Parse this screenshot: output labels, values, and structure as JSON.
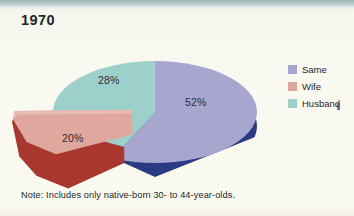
{
  "figure": {
    "title": "1970",
    "note": "Note: Includes only native-born 30- to 44-year-olds.",
    "background_color": "#faf9f2",
    "topbar_color": "#9fb7b8"
  },
  "legend": {
    "position": "right",
    "items": [
      {
        "label": "Same",
        "color": "#a6a6cf",
        "swatch_name": "legend-swatch-same"
      },
      {
        "label": "Wife",
        "color": "#dfa79e",
        "swatch_name": "legend-swatch-wife"
      },
      {
        "label": "Husband",
        "color": "#9ed0cb",
        "swatch_name": "legend-swatch-husband"
      }
    ]
  },
  "labels": {
    "same": "52%",
    "wife": "20%",
    "husband": "28%"
  },
  "chart_data": {
    "type": "pie",
    "title": "1970",
    "xlabel": "",
    "ylabel": "",
    "categories": [
      "Same",
      "Wife",
      "Husband"
    ],
    "values": [
      52,
      20,
      28
    ],
    "value_labels": [
      "52%",
      "20%",
      "28%"
    ],
    "units": "percent",
    "total": 100,
    "exploded_slices": [
      "Wife"
    ],
    "three_d": true,
    "start_angle_deg": 90,
    "direction": "clockwise",
    "slice_colors": {
      "Same_top": "#a6a6cf",
      "Same_side": "#2b3b83",
      "Wife_top": "#dfa79e",
      "Wife_side": "#a8382e",
      "Husband_top": "#9ed0cb",
      "Husband_side": "#3daaa8"
    },
    "legend": [
      "Same",
      "Wife",
      "Husband"
    ],
    "legend_position": "right",
    "grid": false,
    "annotations": [
      "Note: Includes only native-born 30- to 44-year-olds."
    ]
  }
}
